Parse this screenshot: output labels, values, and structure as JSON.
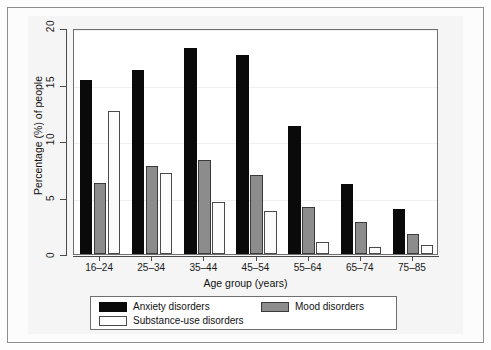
{
  "chart_data": {
    "type": "bar",
    "title": "",
    "xlabel": "Age group (years)",
    "ylabel": "Percentage (%) of people",
    "categories": [
      "16–24",
      "25–34",
      "35–44",
      "45–54",
      "55–64",
      "65–74",
      "75–85"
    ],
    "series": [
      {
        "name": "Anxiety disorders",
        "color": "#0a0a0a",
        "values": [
          15.4,
          16.3,
          18.2,
          17.6,
          11.3,
          6.2,
          4.0
        ]
      },
      {
        "name": "Mood disorders",
        "color": "#8c8c8c",
        "values": [
          6.3,
          7.8,
          8.3,
          7.0,
          4.2,
          2.8,
          1.8
        ]
      },
      {
        "name": "Substance-use disorders",
        "color": "#fdfdfd",
        "values": [
          12.7,
          7.2,
          4.6,
          3.8,
          1.1,
          0.6,
          0.8
        ]
      }
    ],
    "ylim": [
      0,
      20
    ],
    "yticks": [
      0,
      5,
      10,
      15,
      20
    ],
    "ytick_labels": [
      "0",
      "5",
      "10",
      "15",
      "20"
    ],
    "grid": true,
    "legend_position": "bottom"
  },
  "axes": {
    "y_title": "Percentage (%) of people",
    "x_title": "Age group (years)",
    "y_tick_labels": [
      "0",
      "5",
      "10",
      "15",
      "20"
    ],
    "x_tick_labels": [
      "16–24",
      "25–34",
      "35–44",
      "45–54",
      "55–64",
      "65–74",
      "75–85"
    ]
  },
  "legend": {
    "items": [
      {
        "label": "Anxiety disorders",
        "swatch": "black-swatch"
      },
      {
        "label": "Mood disorders",
        "swatch": "grey-swatch"
      },
      {
        "label": "Substance-use disorders",
        "swatch": "white-swatch"
      }
    ]
  }
}
